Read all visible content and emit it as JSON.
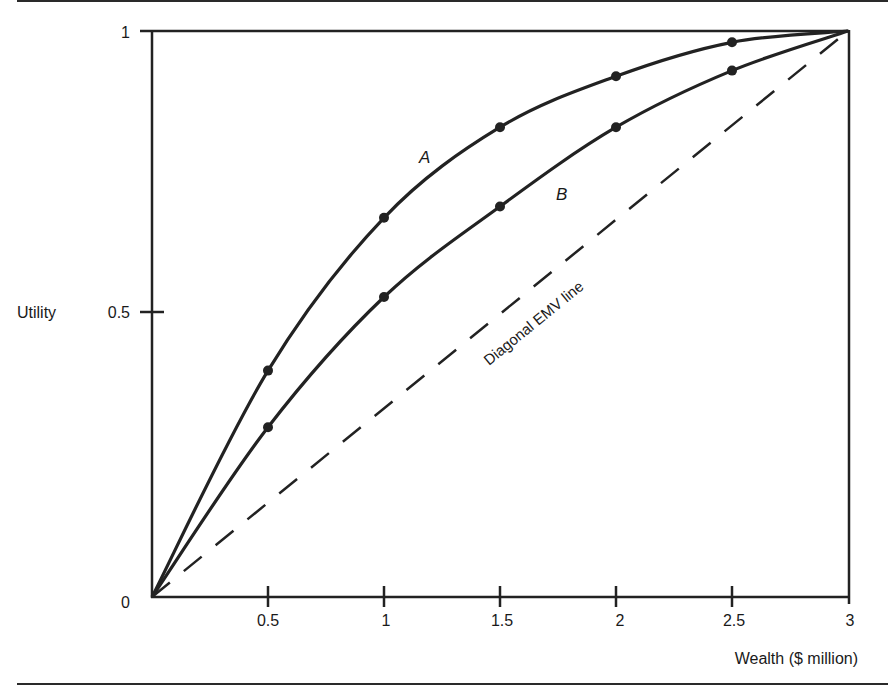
{
  "chart_data": {
    "type": "line",
    "title": "",
    "xlabel": "Wealth ($ million)",
    "ylabel": "Utility",
    "xlim": [
      0,
      3
    ],
    "ylim": [
      0,
      1
    ],
    "x_ticks": [
      0.5,
      1,
      1.5,
      2,
      2.5,
      3
    ],
    "x_tick_labels": [
      "0.5",
      "1",
      "1.5",
      "2",
      "2.5",
      "3"
    ],
    "y_ticks": [
      0,
      0.5,
      1
    ],
    "y_tick_labels": [
      "0",
      "0.5",
      "1"
    ],
    "grid": false,
    "legend": "none (curves labeled inline)",
    "series": [
      {
        "name": "A",
        "style": "solid with markers",
        "x": [
          0,
          0.5,
          1,
          1.5,
          2,
          2.5,
          3
        ],
        "values": [
          0,
          0.4,
          0.67,
          0.83,
          0.92,
          0.98,
          1.0
        ]
      },
      {
        "name": "B",
        "style": "solid with markers",
        "x": [
          0,
          0.5,
          1,
          1.5,
          2,
          2.5,
          3
        ],
        "values": [
          0,
          0.3,
          0.53,
          0.69,
          0.83,
          0.93,
          1.0
        ]
      },
      {
        "name": "Diagonal EMV line",
        "style": "dashed",
        "x": [
          0,
          3
        ],
        "values": [
          0,
          1
        ]
      }
    ],
    "annotations": [
      {
        "text": "A",
        "near_series": "A",
        "x": 1.17,
        "y": 0.78
      },
      {
        "text": "B",
        "near_series": "B",
        "x": 1.76,
        "y": 0.71
      },
      {
        "text": "Diagonal EMV line",
        "along_series": "Diagonal EMV line"
      }
    ]
  },
  "labels": {
    "xlabel": "Wealth ($ million)",
    "ylabel": "Utility",
    "curve_a": "A",
    "curve_b": "B",
    "diagonal": "Diagonal EMV line",
    "y0": "0",
    "y05": "0.5",
    "y1": "1",
    "x05": "0.5",
    "x1": "1",
    "x15": "1.5",
    "x2": "2",
    "x25": "2.5",
    "x3": "3"
  }
}
